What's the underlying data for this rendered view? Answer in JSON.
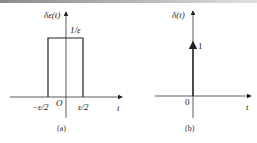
{
  "panel_a": {
    "y_label": "δε(t)",
    "height_label": "1/ε",
    "x_tick_left": "−ε/2",
    "origin_label": "O",
    "x_tick_right": "ε/2",
    "x_axis_label": "t",
    "caption": "(a)"
  },
  "panel_b": {
    "y_label": "δ(t)",
    "impulse_label": "1",
    "origin_label": "0",
    "x_axis_label": "t",
    "caption": "(b)"
  },
  "colors": {
    "line": "#222222",
    "background": "#ffffff"
  }
}
